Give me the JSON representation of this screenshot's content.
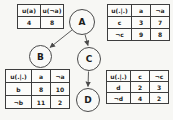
{
  "diagram": {
    "nodes": [
      {
        "id": "A",
        "label": "A"
      },
      {
        "id": "B",
        "label": "B"
      },
      {
        "id": "C",
        "label": "C"
      },
      {
        "id": "D",
        "label": "D"
      }
    ],
    "edges": [
      {
        "from": "A",
        "to": "B"
      },
      {
        "from": "A",
        "to": "C"
      },
      {
        "from": "C",
        "to": "D"
      }
    ],
    "line_color": "#4a4a4a"
  },
  "tables": {
    "utility_a": {
      "headers": [
        "u(a)",
        "u(¬a)"
      ],
      "rows": [
        [
          "4",
          "8"
        ]
      ]
    },
    "utility_c": {
      "headers": [
        "u(.|.)",
        "a",
        "¬a"
      ],
      "rows": [
        [
          "c",
          "3",
          "7"
        ],
        [
          "¬c",
          "9",
          "8"
        ]
      ]
    },
    "utility_b": {
      "headers": [
        "u(.|.)",
        "a",
        "¬a"
      ],
      "rows": [
        [
          "b",
          "8",
          "10"
        ],
        [
          "¬b",
          "11",
          "2"
        ]
      ]
    },
    "utility_d": {
      "headers": [
        "u(.|.)",
        "c",
        "¬c"
      ],
      "rows": [
        [
          "d",
          "2",
          "3"
        ],
        [
          "¬d",
          "4",
          "2"
        ]
      ]
    }
  }
}
